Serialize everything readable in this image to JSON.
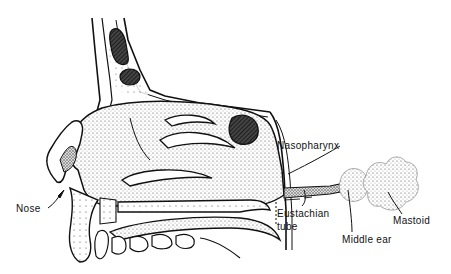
{
  "figure": {
    "type": "anatomical-diagram",
    "labels": {
      "nasopharynx": "Nasopharynx",
      "nose": "Nose",
      "eustachian_line1": "Eustachian",
      "eustachian_line2": "tube",
      "middle_ear": "Middle ear",
      "mastoid": "Mastoid"
    },
    "colors": {
      "ink": "#111111",
      "background": "#ffffff",
      "stipple": "#555555"
    }
  }
}
